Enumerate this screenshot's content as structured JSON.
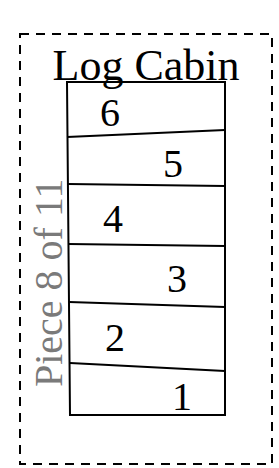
{
  "pattern": {
    "title": "Log Cabin",
    "piece_label": "Piece 8 of 11"
  },
  "strips": [
    {
      "number": "6"
    },
    {
      "number": "5"
    },
    {
      "number": "4"
    },
    {
      "number": "3"
    },
    {
      "number": "2"
    },
    {
      "number": "1"
    }
  ],
  "colors": {
    "outline": "#000000",
    "side_text": "#7a7a7a"
  }
}
